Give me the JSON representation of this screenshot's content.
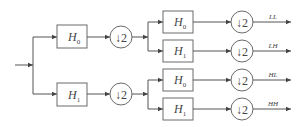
{
  "diagram": {
    "input": {
      "label": ""
    },
    "stage1": {
      "filters": [
        {
          "name": "H",
          "sub": "0"
        },
        {
          "name": "H",
          "sub": "1"
        }
      ],
      "downsample": [
        "↓2",
        "↓2"
      ]
    },
    "stage2": {
      "filters": [
        {
          "name": "H",
          "sub": "0"
        },
        {
          "name": "H",
          "sub": "1"
        },
        {
          "name": "H",
          "sub": "0"
        },
        {
          "name": "H",
          "sub": "1"
        }
      ],
      "downsample": [
        "↓2",
        "↓2",
        "↓2",
        "↓2"
      ]
    },
    "outputs": [
      "LL",
      "LH",
      "HL",
      "HH"
    ]
  }
}
